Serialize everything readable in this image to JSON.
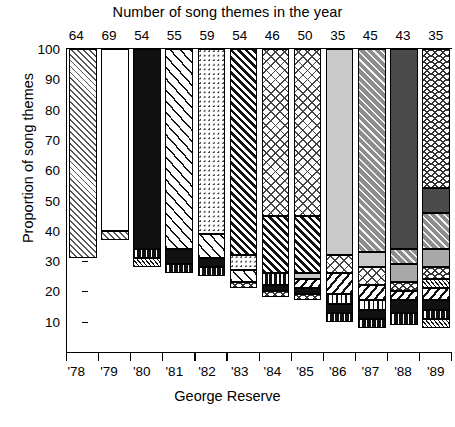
{
  "chart_data": {
    "type": "bar",
    "stacked": true,
    "title": "Number of song themes in the year",
    "xlabel": "George Reserve",
    "ylabel": "Proportion of song themes",
    "ylim": [
      0,
      100
    ],
    "yticks": [
      10,
      20,
      30,
      40,
      50,
      60,
      70,
      80,
      90,
      100
    ],
    "grid": false,
    "legend": "none",
    "categories": [
      "'78",
      "'79",
      "'80",
      "'81",
      "'82",
      "'83",
      "'84",
      "'85",
      "'86",
      "'87",
      "'88",
      "'89"
    ],
    "top_axis_label": "Number of song themes in the year",
    "top_axis_values": [
      64,
      69,
      54,
      55,
      59,
      54,
      46,
      50,
      35,
      45,
      43,
      35
    ],
    "bars": [
      {
        "category": "'78",
        "segments": [
          {
            "label": "theme-a",
            "pattern": "diagonal-hatch-gray",
            "from": 31,
            "to": 100,
            "value": 69
          }
        ]
      },
      {
        "category": "'79",
        "segments": [
          {
            "label": "theme-b",
            "pattern": "vertical-dotted-columns",
            "from": 40,
            "to": 100,
            "value": 60
          },
          {
            "label": "theme-a",
            "pattern": "diagonal-hatch-gray",
            "from": 37,
            "to": 40,
            "value": 3
          }
        ]
      },
      {
        "category": "'80",
        "segments": [
          {
            "label": "theme-c",
            "pattern": "solid-black",
            "from": 34,
            "to": 100,
            "value": 66
          },
          {
            "label": "theme-d",
            "pattern": "chain-dash",
            "from": 31,
            "to": 34,
            "value": 3
          },
          {
            "label": "theme-a",
            "pattern": "diagonal-hatch-fine",
            "from": 28,
            "to": 31,
            "value": 3
          }
        ]
      },
      {
        "category": "'81",
        "segments": [
          {
            "label": "theme-e",
            "pattern": "diagonal-wide-white",
            "from": 34,
            "to": 100,
            "value": 66
          },
          {
            "label": "theme-c",
            "pattern": "solid-black",
            "from": 29,
            "to": 34,
            "value": 5
          },
          {
            "label": "theme-d",
            "pattern": "chain-dash",
            "from": 26,
            "to": 29,
            "value": 3
          }
        ]
      },
      {
        "category": "'82",
        "segments": [
          {
            "label": "theme-f",
            "pattern": "dot-grid",
            "from": 39,
            "to": 100,
            "value": 61
          },
          {
            "label": "theme-e",
            "pattern": "diagonal-wide-white",
            "from": 31,
            "to": 39,
            "value": 8
          },
          {
            "label": "theme-c",
            "pattern": "solid-black",
            "from": 28,
            "to": 31,
            "value": 3
          },
          {
            "label": "theme-d",
            "pattern": "chain-dash",
            "from": 25,
            "to": 28,
            "value": 3
          }
        ]
      },
      {
        "category": "'83",
        "segments": [
          {
            "label": "theme-g",
            "pattern": "diagonal-heavy-black",
            "from": 32,
            "to": 100,
            "value": 68
          },
          {
            "label": "theme-f",
            "pattern": "dot-grid",
            "from": 27,
            "to": 32,
            "value": 5
          },
          {
            "label": "theme-e",
            "pattern": "diagonal-wide-white",
            "from": 23,
            "to": 27,
            "value": 4
          },
          {
            "label": "theme-h",
            "pattern": "wave-zigzag",
            "from": 21,
            "to": 23,
            "value": 2
          }
        ]
      },
      {
        "category": "'84",
        "segments": [
          {
            "label": "theme-i",
            "pattern": "crosshatch-light",
            "from": 45,
            "to": 100,
            "value": 55
          },
          {
            "label": "theme-g",
            "pattern": "diagonal-heavy-black",
            "from": 26,
            "to": 45,
            "value": 19
          },
          {
            "label": "theme-f",
            "pattern": "horizontal-dash",
            "from": 22,
            "to": 26,
            "value": 4
          },
          {
            "label": "theme-c",
            "pattern": "solid-black",
            "from": 20,
            "to": 22,
            "value": 2
          },
          {
            "label": "theme-h",
            "pattern": "wave-zigzag",
            "from": 18,
            "to": 20,
            "value": 2
          }
        ]
      },
      {
        "category": "'85",
        "segments": [
          {
            "label": "theme-i",
            "pattern": "crosshatch-light",
            "from": 45,
            "to": 100,
            "value": 55
          },
          {
            "label": "theme-g",
            "pattern": "diagonal-heavy-black",
            "from": 26,
            "to": 45,
            "value": 19
          },
          {
            "label": "theme-j",
            "pattern": "light-gray",
            "from": 24,
            "to": 26,
            "value": 2
          },
          {
            "label": "theme-e",
            "pattern": "diagonal-right",
            "from": 21,
            "to": 24,
            "value": 3
          },
          {
            "label": "theme-c",
            "pattern": "solid-black",
            "from": 19,
            "to": 21,
            "value": 2
          },
          {
            "label": "theme-h",
            "pattern": "wave-zigzag",
            "from": 17,
            "to": 19,
            "value": 2
          }
        ]
      },
      {
        "category": "'86",
        "segments": [
          {
            "label": "theme-k",
            "pattern": "light-gray",
            "from": 32,
            "to": 100,
            "value": 68
          },
          {
            "label": "theme-i",
            "pattern": "crosshatch-light",
            "from": 26,
            "to": 32,
            "value": 6
          },
          {
            "label": "theme-e",
            "pattern": "diagonal-right",
            "from": 19,
            "to": 26,
            "value": 7
          },
          {
            "label": "theme-l",
            "pattern": "vertical-dash",
            "from": 16,
            "to": 19,
            "value": 3
          },
          {
            "label": "theme-c",
            "pattern": "solid-black",
            "from": 13,
            "to": 16,
            "value": 3
          },
          {
            "label": "theme-d",
            "pattern": "chain-dash",
            "from": 10,
            "to": 13,
            "value": 3
          }
        ]
      },
      {
        "category": "'87",
        "segments": [
          {
            "label": "theme-m",
            "pattern": "dark-gray-diagonal",
            "from": 33,
            "to": 100,
            "value": 67
          },
          {
            "label": "theme-j",
            "pattern": "light-gray",
            "from": 28,
            "to": 33,
            "value": 5
          },
          {
            "label": "theme-i",
            "pattern": "crosshatch-light",
            "from": 22,
            "to": 28,
            "value": 6
          },
          {
            "label": "theme-e",
            "pattern": "diagonal-right",
            "from": 17,
            "to": 22,
            "value": 5
          },
          {
            "label": "theme-l",
            "pattern": "vertical-dash",
            "from": 14,
            "to": 17,
            "value": 3
          },
          {
            "label": "theme-c",
            "pattern": "solid-black",
            "from": 11,
            "to": 14,
            "value": 3
          },
          {
            "label": "theme-d",
            "pattern": "chain-dash",
            "from": 8,
            "to": 11,
            "value": 3
          }
        ]
      },
      {
        "category": "'88",
        "segments": [
          {
            "label": "theme-n",
            "pattern": "dark-gray",
            "from": 34,
            "to": 100,
            "value": 66
          },
          {
            "label": "theme-m",
            "pattern": "dark-gray-diagonal",
            "from": 29,
            "to": 34,
            "value": 5
          },
          {
            "label": "theme-j",
            "pattern": "medium-gray",
            "from": 23,
            "to": 29,
            "value": 6
          },
          {
            "label": "theme-h",
            "pattern": "wave-zigzag",
            "from": 20,
            "to": 23,
            "value": 3
          },
          {
            "label": "theme-e",
            "pattern": "diagonal-right",
            "from": 17,
            "to": 20,
            "value": 3
          },
          {
            "label": "theme-c",
            "pattern": "solid-black",
            "from": 13,
            "to": 17,
            "value": 4
          },
          {
            "label": "theme-d",
            "pattern": "chain-dash",
            "from": 9,
            "to": 13,
            "value": 4
          }
        ]
      },
      {
        "category": "'89",
        "segments": [
          {
            "label": "theme-h",
            "pattern": "wave-zigzag",
            "from": 54,
            "to": 100,
            "value": 46
          },
          {
            "label": "theme-n",
            "pattern": "dark-gray",
            "from": 46,
            "to": 54,
            "value": 8
          },
          {
            "label": "theme-m",
            "pattern": "dark-gray-diagonal",
            "from": 34,
            "to": 46,
            "value": 12
          },
          {
            "label": "theme-j",
            "pattern": "medium-gray",
            "from": 28,
            "to": 34,
            "value": 6
          },
          {
            "label": "theme-i",
            "pattern": "wave-zigzag",
            "from": 24,
            "to": 28,
            "value": 4
          },
          {
            "label": "theme-l",
            "pattern": "diagonal-hatch-fine",
            "from": 21,
            "to": 24,
            "value": 3
          },
          {
            "label": "theme-e",
            "pattern": "diagonal-right",
            "from": 17,
            "to": 21,
            "value": 4
          },
          {
            "label": "theme-c",
            "pattern": "solid-black",
            "from": 14,
            "to": 17,
            "value": 3
          },
          {
            "label": "theme-d",
            "pattern": "chain-dash",
            "from": 11,
            "to": 14,
            "value": 3
          },
          {
            "label": "theme-a",
            "pattern": "diagonal-hatch-fine",
            "from": 8,
            "to": 11,
            "value": 3
          }
        ]
      }
    ]
  }
}
